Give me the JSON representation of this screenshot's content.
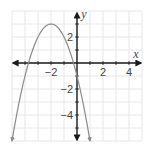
{
  "chart_data": {
    "type": "line",
    "title": "",
    "xlabel": "x",
    "ylabel": "y",
    "xlim": [
      -5,
      5
    ],
    "ylim": [
      -6,
      4
    ],
    "grid": true,
    "x_ticks": [
      -2,
      2,
      4
    ],
    "x_tick_labels": [
      "−2",
      "2",
      "4"
    ],
    "y_ticks": [
      2,
      -2,
      -4
    ],
    "y_tick_labels": [
      "2",
      "−2",
      "−4"
    ],
    "series": [
      {
        "name": "parabola",
        "equation": "y = -(x + 2)^2 + 3",
        "vertex": [
          -2,
          3
        ],
        "x_intercepts": [
          -3.73,
          -0.27
        ],
        "y_intercept": -1,
        "x": [
          -5,
          -4,
          -3.73,
          -3,
          -2,
          -1,
          -0.27,
          0,
          1
        ],
        "y": [
          -6,
          -1,
          0,
          2,
          3,
          2,
          0,
          -1,
          -6
        ],
        "color": "#8a8a8a",
        "arrows_at_ends": true
      }
    ]
  },
  "colors": {
    "grid": "#e6e6e6",
    "axis": "#1a1a1a",
    "curve": "#8a8a8a",
    "text": "#444444"
  }
}
